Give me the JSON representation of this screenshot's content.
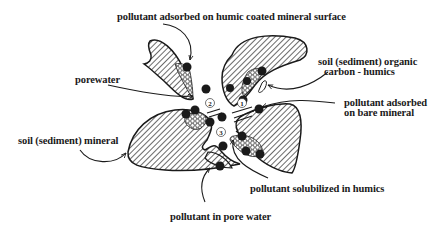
{
  "diagram": {
    "type": "soil particle pollutant partitioning diagram",
    "labels": {
      "humic_coated": "pollutant adsorbed on humic coated mineral surface",
      "porewater": "porewater",
      "organic_carbon_1": "soil (sediment) organic",
      "organic_carbon_2": "carbon - humics",
      "bare_mineral_1": "pollutant adsorbed",
      "bare_mineral_2": "on bare mineral",
      "soil_mineral": "soil (sediment) mineral",
      "solubilized": "pollutant solubilized in humics",
      "pore_water_pollutant": "pollutant in pore water"
    },
    "process_numbers": {
      "one": "1",
      "two": "2",
      "three": "3"
    },
    "legend_patterns": {
      "mineral": "diagonal hatch",
      "humics": "hexagonal mesh",
      "pollutant": "black dot"
    },
    "colors": {
      "ink": "#1a1a1a",
      "background": "#ffffff"
    }
  }
}
